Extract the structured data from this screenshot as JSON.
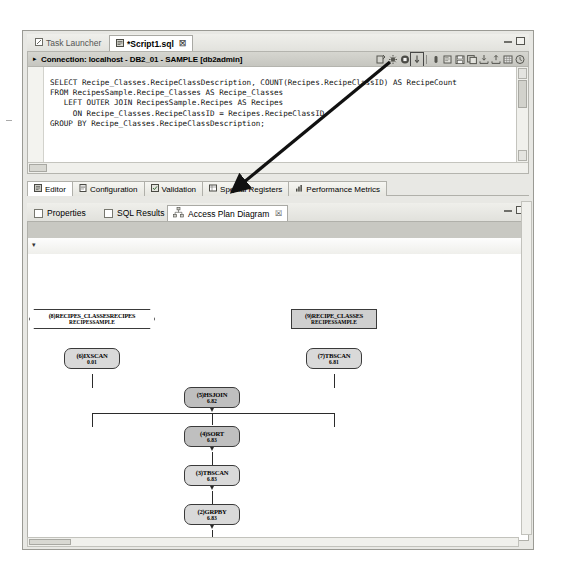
{
  "window": {
    "minimize_label": "Minimize",
    "maximize_label": "Maximize"
  },
  "editor": {
    "tabs": [
      {
        "label": "Task Launcher",
        "icon": "task-launcher-icon",
        "active": false,
        "closable": false
      },
      {
        "label": "*Script1.sql",
        "icon": "sql-script-icon",
        "active": true,
        "closable": true
      }
    ],
    "close_glyph": "☒",
    "connection": {
      "expander": "▸",
      "text": "Connection: localhost - DB2_01 - SAMPLE [db2admin]"
    },
    "toolbar": [
      {
        "name": "run-sql-icon",
        "selected": false
      },
      {
        "name": "settings-gear-icon",
        "selected": false
      },
      {
        "name": "stop-icon",
        "selected": false
      },
      {
        "name": "explain-access-plan-icon",
        "selected": true
      },
      {
        "name": "debug-icon",
        "selected": false
      },
      {
        "name": "open-file-icon",
        "selected": false
      },
      {
        "name": "save-icon",
        "selected": false
      },
      {
        "name": "save-all-icon",
        "selected": false
      },
      {
        "name": "import-icon",
        "selected": false
      },
      {
        "name": "export-icon",
        "selected": false
      },
      {
        "name": "grid-icon",
        "selected": false
      },
      {
        "name": "history-clock-icon",
        "selected": false
      }
    ],
    "sql": "SELECT Recipe_Classes.RecipeClassDescription, COUNT(Recipes.RecipeClassID) AS RecipeCount\nFROM RecipesSample.Recipe_Classes AS Recipe_Classes\n   LEFT OUTER JOIN RecipesSample.Recipes AS Recipes\n     ON Recipe_Classes.RecipeClassID = Recipes.RecipeClassID\nGROUP BY Recipe_Classes.RecipeClassDescription;",
    "bottom_tabs": [
      {
        "label": "Editor",
        "icon": "editor-icon",
        "active": true
      },
      {
        "label": "Configuration",
        "icon": "configuration-icon",
        "active": false
      },
      {
        "label": "Validation",
        "icon": "validation-icon",
        "active": false
      },
      {
        "label": "Special Registers",
        "icon": "special-registers-icon",
        "active": false
      },
      {
        "label": "Performance Metrics",
        "icon": "performance-metrics-icon",
        "active": false
      }
    ]
  },
  "results": {
    "tabs": [
      {
        "label": "Properties",
        "icon": "properties-icon",
        "active": false,
        "closable": false
      },
      {
        "label": "SQL Results",
        "icon": "sql-results-icon",
        "active": false,
        "closable": false
      },
      {
        "label": "Access Plan Diagram",
        "icon": "access-plan-diagram-icon",
        "active": true,
        "closable": true
      }
    ],
    "close_glyph": "☒",
    "caret": "▾"
  },
  "access_plan": {
    "nodes": [
      {
        "id": "return",
        "seq": "(1)",
        "operator": "RETURN",
        "cost": "6.83",
        "shape": "ellipse"
      },
      {
        "id": "grpby",
        "seq": "(2)",
        "operator": "GRPBY",
        "cost": "6.83",
        "shape": "rounded"
      },
      {
        "id": "tbscan_top",
        "seq": "(3)",
        "operator": "TBSCAN",
        "cost": "6.83",
        "shape": "rounded"
      },
      {
        "id": "sort",
        "seq": "(4)",
        "operator": "SORT",
        "cost": "6.83",
        "shape": "rounded"
      },
      {
        "id": "hsjoin",
        "seq": "(5)",
        "operator": "HSJOIN",
        "cost": "6.82",
        "shape": "rounded"
      },
      {
        "id": "ixscan",
        "seq": "(6)",
        "operator": "IXSCAN",
        "cost": "0.01",
        "shape": "rounded"
      },
      {
        "id": "tbscan_right",
        "seq": "(7)",
        "operator": "TBSCAN",
        "cost": "6.81",
        "shape": "rounded"
      },
      {
        "id": "index",
        "seq": "(8)",
        "operator": "RECIPES_CLASSESRECIPES",
        "cost": "RECIPESSAMPLE",
        "shape": "index"
      },
      {
        "id": "table",
        "seq": "(9)",
        "operator": "RECIPE_CLASSES",
        "cost": "RECIPESSAMPLE",
        "shape": "table"
      }
    ]
  }
}
